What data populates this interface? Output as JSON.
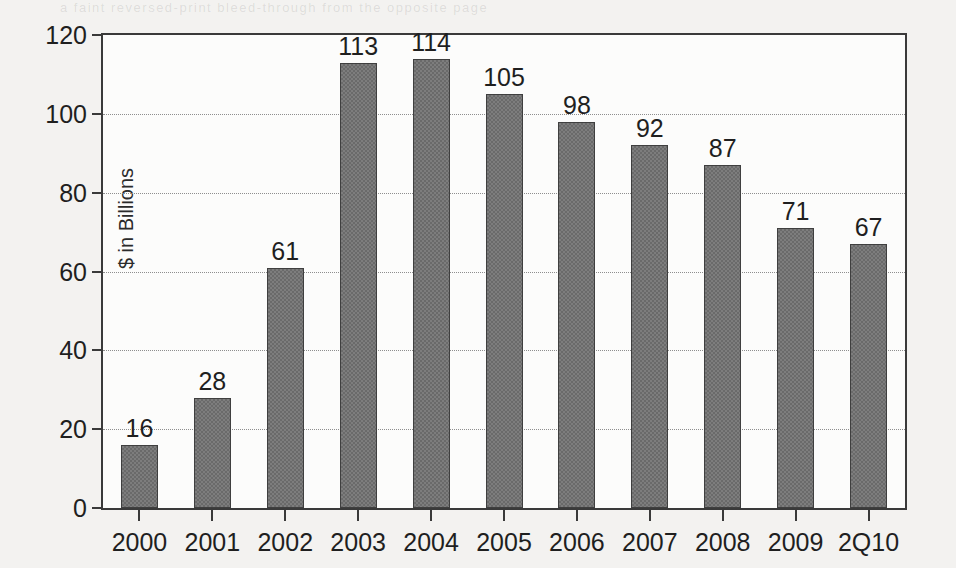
{
  "page": {
    "bleed_text": "a faint reversed-print bleed-through from the opposite page"
  },
  "chart_data": {
    "type": "bar",
    "title": "",
    "subtitle": "",
    "xlabel": "",
    "ylabel": "$ in Billions",
    "categories": [
      "2000",
      "2001",
      "2002",
      "2003",
      "2004",
      "2005",
      "2006",
      "2007",
      "2008",
      "2009",
      "2Q10"
    ],
    "values": [
      16,
      28,
      61,
      113,
      114,
      105,
      98,
      92,
      87,
      71,
      67
    ],
    "data_labels": [
      "16",
      "28",
      "61",
      "113",
      "114",
      "105",
      "98",
      "92",
      "87",
      "71",
      "67"
    ],
    "ylim": [
      0,
      120
    ],
    "ytick_values": [
      0,
      20,
      40,
      60,
      80,
      100,
      120
    ],
    "ytick_labels": [
      "0",
      "20",
      "40",
      "60",
      "80",
      "100",
      "120"
    ],
    "grid": true,
    "grid_axis": "y",
    "grid_style": "dotted",
    "legend": false,
    "legend_position": "none",
    "series": [
      {
        "name": "",
        "values": [
          16,
          28,
          61,
          113,
          114,
          105,
          98,
          92,
          87,
          71,
          67
        ],
        "color": "#7d7d7d",
        "edge_color": "#3f3f3f",
        "pattern": "checkerboard-dither"
      }
    ],
    "colors": {
      "bar_fill": "#7d7d7d",
      "bar_edge": "#3f3f3f",
      "axis": "#3a3a3a",
      "grid": "#8e8e8e",
      "text": "#1f1f1f",
      "plot_background": "#fcfcfb",
      "page_background": "#f3f2f0"
    }
  }
}
